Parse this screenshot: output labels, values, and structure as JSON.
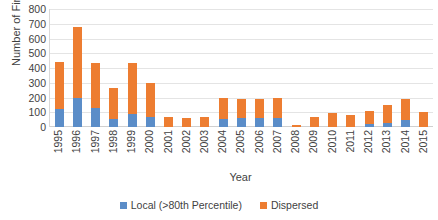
{
  "chart_data": {
    "type": "bar",
    "stacked": true,
    "title": "",
    "xlabel": "Year",
    "ylabel": "Number of Firms",
    "ylim": [
      0,
      800
    ],
    "ytick_step": 100,
    "yticks": [
      800,
      700,
      600,
      500,
      400,
      300,
      200,
      100,
      0
    ],
    "grid": true,
    "legend_position": "bottom",
    "categories": [
      "1995",
      "1996",
      "1997",
      "1998",
      "1999",
      "2000",
      "2001",
      "2002",
      "2003",
      "2004",
      "2005",
      "2006",
      "2007",
      "2008",
      "2009",
      "2010",
      "2011",
      "2012",
      "2013",
      "2014",
      "2015"
    ],
    "series": [
      {
        "name": "Local (>80th Percentile)",
        "color": "#5B8DC8",
        "values": [
          125,
          195,
          130,
          55,
          85,
          70,
          0,
          0,
          0,
          55,
          60,
          60,
          60,
          0,
          0,
          0,
          0,
          20,
          25,
          45,
          0
        ]
      },
      {
        "name": "Dispersed",
        "color": "#ED7D31",
        "values": [
          315,
          480,
          305,
          210,
          350,
          230,
          70,
          60,
          65,
          145,
          130,
          130,
          135,
          15,
          65,
          95,
          80,
          90,
          125,
          145,
          105
        ]
      }
    ],
    "totals": [
      440,
      675,
      435,
      265,
      435,
      300,
      70,
      60,
      65,
      200,
      190,
      190,
      195,
      15,
      65,
      95,
      80,
      110,
      150,
      190,
      105
    ]
  }
}
